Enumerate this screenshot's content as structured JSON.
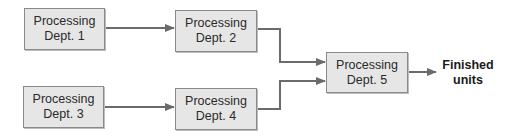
{
  "diagram": {
    "type": "flowchart",
    "nodes": [
      {
        "id": "d1",
        "line1": "Processing",
        "line2": "Dept. 1"
      },
      {
        "id": "d2",
        "line1": "Processing",
        "line2": "Dept. 2"
      },
      {
        "id": "d3",
        "line1": "Processing",
        "line2": "Dept. 3"
      },
      {
        "id": "d4",
        "line1": "Processing",
        "line2": "Dept. 4"
      },
      {
        "id": "d5",
        "line1": "Processing",
        "line2": "Dept. 5"
      }
    ],
    "output": {
      "line1": "Finished",
      "line2": "units"
    },
    "edges": [
      {
        "from": "d1",
        "to": "d2"
      },
      {
        "from": "d3",
        "to": "d4"
      },
      {
        "from": "d2",
        "to": "d5"
      },
      {
        "from": "d4",
        "to": "d5"
      },
      {
        "from": "d5",
        "to": "output"
      }
    ],
    "colors": {
      "box_fill": "#e6e6e6",
      "box_border": "#8a8a8a",
      "arrow": "#6b6b6b"
    }
  }
}
